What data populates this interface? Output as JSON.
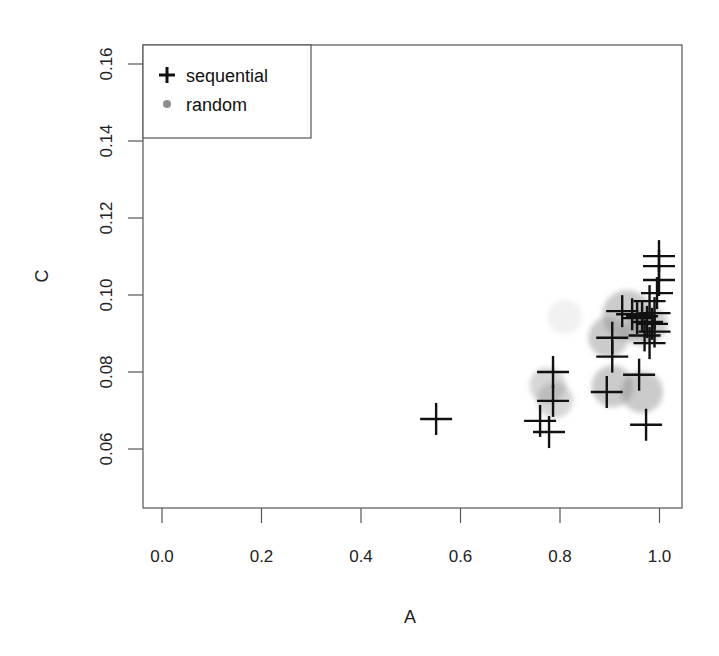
{
  "chart_data": {
    "type": "scatter",
    "title": "",
    "xlabel": "A",
    "ylabel": "C",
    "xlim": [
      -0.04,
      1.04
    ],
    "ylim": [
      0.045,
      0.164
    ],
    "grid": false,
    "legend_position": "top-left",
    "x_ticks": [
      "0.0",
      "0.2",
      "0.4",
      "0.6",
      "0.8",
      "1.0"
    ],
    "x_tick_values": [
      0.0,
      0.2,
      0.4,
      0.6,
      0.8,
      1.0
    ],
    "y_ticks": [
      "0.06",
      "0.08",
      "0.10",
      "0.12",
      "0.14",
      "0.16"
    ],
    "y_tick_values": [
      0.06,
      0.08,
      0.1,
      0.12,
      0.14,
      0.16
    ],
    "series": [
      {
        "name": "sequential",
        "marker": "plus",
        "color": "#111111",
        "points": [
          {
            "A": 0.551,
            "C": 0.0678
          },
          {
            "A": 0.786,
            "C": 0.08
          },
          {
            "A": 0.786,
            "C": 0.0725
          },
          {
            "A": 0.76,
            "C": 0.0673
          },
          {
            "A": 0.778,
            "C": 0.0644
          },
          {
            "A": 0.894,
            "C": 0.0748
          },
          {
            "A": 0.959,
            "C": 0.0793
          },
          {
            "A": 0.973,
            "C": 0.0663
          },
          {
            "A": 0.905,
            "C": 0.084
          },
          {
            "A": 0.905,
            "C": 0.0889
          },
          {
            "A": 0.999,
            "C": 0.1101
          },
          {
            "A": 0.999,
            "C": 0.1075
          },
          {
            "A": 0.999,
            "C": 0.1039
          },
          {
            "A": 0.995,
            "C": 0.1005
          },
          {
            "A": 0.98,
            "C": 0.0984
          },
          {
            "A": 0.925,
            "C": 0.0958
          },
          {
            "A": 0.945,
            "C": 0.095
          },
          {
            "A": 0.955,
            "C": 0.094
          },
          {
            "A": 0.965,
            "C": 0.0945
          },
          {
            "A": 0.975,
            "C": 0.093
          },
          {
            "A": 0.99,
            "C": 0.0953
          },
          {
            "A": 0.985,
            "C": 0.0925
          },
          {
            "A": 0.99,
            "C": 0.0905
          },
          {
            "A": 0.98,
            "C": 0.0875
          },
          {
            "A": 0.97,
            "C": 0.0895
          }
        ]
      },
      {
        "name": "random",
        "marker": "circle",
        "color": "#8c8c8c",
        "points": [
          {
            "A": 0.775,
            "C": 0.0765,
            "r": 18,
            "alpha": 0.35
          },
          {
            "A": 0.79,
            "C": 0.0727,
            "r": 18,
            "alpha": 0.35
          },
          {
            "A": 0.81,
            "C": 0.0943,
            "r": 17,
            "alpha": 0.12
          },
          {
            "A": 0.935,
            "C": 0.0948,
            "r": 25,
            "alpha": 0.45
          },
          {
            "A": 0.897,
            "C": 0.089,
            "r": 20,
            "alpha": 0.45
          },
          {
            "A": 0.906,
            "C": 0.0763,
            "r": 21,
            "alpha": 0.45
          },
          {
            "A": 0.965,
            "C": 0.0748,
            "r": 21,
            "alpha": 0.45
          },
          {
            "A": 0.98,
            "C": 0.0925,
            "r": 18,
            "alpha": 0.4
          },
          {
            "A": 0.96,
            "C": 0.091,
            "r": 16,
            "alpha": 0.35
          }
        ]
      }
    ]
  },
  "legend": {
    "items": [
      {
        "label": "sequential",
        "marker": "plus"
      },
      {
        "label": "random",
        "marker": "dot"
      }
    ]
  },
  "axes": {
    "x_title": "A",
    "y_title": "C"
  }
}
